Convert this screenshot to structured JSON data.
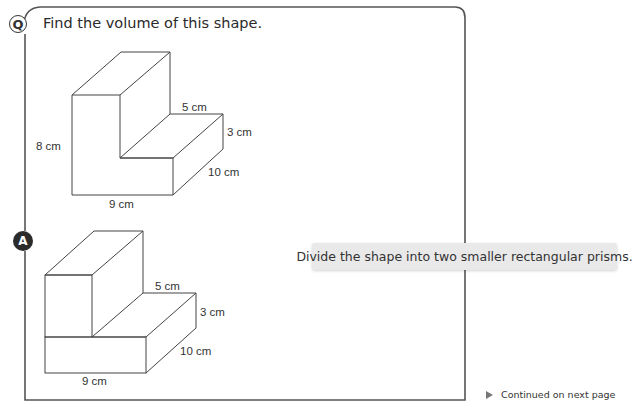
{
  "question": {
    "badge": "Q",
    "text": "Find the volume of this shape.",
    "figure": {
      "labels": {
        "height": "8 cm",
        "width": "9 cm",
        "step_width": "5 cm",
        "step_height": "3 cm",
        "depth": "10 cm"
      }
    }
  },
  "answer": {
    "badge": "A",
    "figure": {
      "labels": {
        "width": "9 cm",
        "step_width": "5 cm",
        "step_height": "3 cm",
        "depth": "10 cm"
      }
    },
    "hint": "Divide the shape into two smaller rectangular prisms."
  },
  "footer": {
    "continued": "Continued on next page",
    "icon": "play-triangle-icon"
  },
  "colors": {
    "frame": "#555555",
    "line": "#444444",
    "callout_bg": "#e9e9e9",
    "badge_dark": "#2b2b2b"
  }
}
